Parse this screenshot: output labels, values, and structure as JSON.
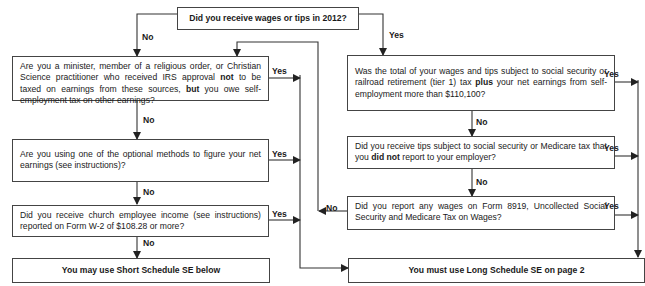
{
  "flowchart": {
    "start": "Did you receive wages or tips in 2012?",
    "left_questions": [
      {
        "parts": [
          "Are you a minister, member of a religious order, or Christian Science practitioner who received IRS approval ",
          "not",
          " to be taxed on earnings from these sources, ",
          "but",
          " you owe self-employment tax on other earnings?"
        ]
      },
      {
        "parts": [
          "Are you using one of the optional methods to figure your net earnings (see instructions)?"
        ]
      },
      {
        "parts": [
          "Did you receive church employee income (see instructions) reported on Form  W-2 of $108.28 or more?"
        ]
      }
    ],
    "right_questions": [
      {
        "parts": [
          "Was the total of your wages and tips subject to social security or railroad retirement (tier 1) tax ",
          "plus",
          " your net earnings from self-employment more than $110,100?"
        ]
      },
      {
        "parts": [
          "Did you receive tips subject to social security or Medicare tax that you ",
          "did not",
          " report to your employer?"
        ]
      },
      {
        "parts": [
          "Did you report any wages on Form 8919, Uncollected Social Security and Medicare Tax on Wages?"
        ]
      }
    ],
    "outcomes": {
      "short": "You may use Short Schedule SE below",
      "long": "You must use Long Schedule SE on page 2"
    },
    "labels": {
      "yes": "Yes",
      "no": "No"
    }
  }
}
